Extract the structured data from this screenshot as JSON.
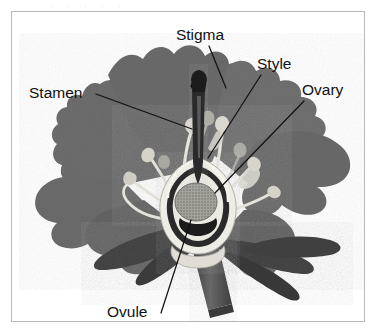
{
  "page": {
    "background_color": "#ffffff",
    "scan_artifact_top": ". .  .   .    .",
    "frame_border_color": "#b9b9b9"
  },
  "figure": {
    "style": "grayscale halftone botanical illustration",
    "colors": {
      "petal": "#6e6e6e",
      "petal_shadow": "#585858",
      "leaf_dark": "#4a4a4a",
      "stem": "#5c5c5c",
      "filament": "#e8e8e6",
      "anther": "#d8d8d4",
      "ovary_wall": "#f0efe9",
      "ovary_inner": "#2c2c2c",
      "ovule": "#9a9a94",
      "style_column": "#2a2a2a",
      "label_text": "#111111",
      "leader_line": "#111111"
    }
  },
  "labels": [
    {
      "id": "stigma",
      "text": "Stigma",
      "x": 188,
      "y": 28,
      "anchor": "middle",
      "leader": "M 197 34 L 214 76"
    },
    {
      "id": "style",
      "text": "Style",
      "x": 245,
      "y": 57,
      "anchor": "start",
      "leader": "M 249 63 L 196 146"
    },
    {
      "id": "ovary",
      "text": "Ovary",
      "x": 290,
      "y": 83,
      "anchor": "start",
      "leader": "M 292 89 L 203 181"
    },
    {
      "id": "stamen",
      "text": "Stamen",
      "x": 17,
      "y": 86,
      "anchor": "start",
      "leader": "M 84 82 L 180 117"
    },
    {
      "id": "ovule",
      "text": "Ovule",
      "x": 95,
      "y": 305,
      "anchor": "start",
      "leader": "M 149 301 L 179 208"
    }
  ],
  "anatomy_parts": [
    {
      "name": "stigma",
      "description": "dark tip at top of the central style column"
    },
    {
      "name": "style",
      "description": "dark vertical column descending from stigma to ovary"
    },
    {
      "name": "ovary",
      "description": "pale swollen chamber at flower base, shown in cut-away"
    },
    {
      "name": "ovule",
      "description": "stippled round body inside the ovary chamber"
    },
    {
      "name": "stamen",
      "description": "slender pale filaments topped with rounded anthers"
    },
    {
      "name": "petals",
      "description": "broad wavy-lobed grey petals fanning outward"
    },
    {
      "name": "sepals",
      "description": "dark narrow leaf-like structures below the ovary"
    },
    {
      "name": "stem",
      "description": "thick stalk descending to lower right"
    }
  ]
}
